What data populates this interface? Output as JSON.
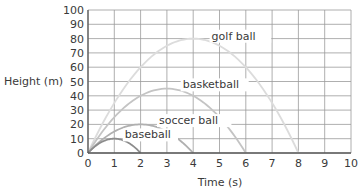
{
  "chart_data": {
    "type": "line",
    "title": "",
    "xlabel": "Time (s)",
    "ylabel": "Height (m)",
    "xlim": [
      0,
      10
    ],
    "ylim": [
      0,
      100
    ],
    "x_ticks": [
      0,
      1,
      2,
      3,
      4,
      5,
      6,
      7,
      8,
      9,
      10
    ],
    "y_ticks": [
      0,
      10,
      20,
      30,
      40,
      50,
      60,
      70,
      80,
      90,
      100
    ],
    "grid": true,
    "legend": "inline labels",
    "series": [
      {
        "name": "baseball",
        "peak_time": 1,
        "peak_height": 10,
        "land_time": 2,
        "x": [
          0,
          0.5,
          1,
          1.5,
          2
        ],
        "y": [
          0,
          7.5,
          10,
          7.5,
          0
        ],
        "color": "#8c8c8c"
      },
      {
        "name": "soccer ball",
        "peak_time": 2,
        "peak_height": 20,
        "land_time": 4,
        "x": [
          0,
          1,
          2,
          3,
          4
        ],
        "y": [
          0,
          15,
          20,
          15,
          0
        ],
        "color": "#b0b0b0"
      },
      {
        "name": "basketball",
        "peak_time": 3,
        "peak_height": 45,
        "land_time": 6,
        "x": [
          0,
          1.5,
          3,
          4.5,
          6
        ],
        "y": [
          0,
          33.75,
          45,
          33.75,
          0
        ],
        "color": "#c4c4c4"
      },
      {
        "name": "golf ball",
        "peak_time": 4,
        "peak_height": 80,
        "land_time": 8,
        "x": [
          0,
          2,
          4,
          6,
          8
        ],
        "y": [
          0,
          60,
          80,
          60,
          0
        ],
        "color": "#dcdcdc"
      }
    ],
    "labels": [
      {
        "text": "golf ball",
        "x": 4.7,
        "y": 82
      },
      {
        "text": "basketball",
        "x": 3.6,
        "y": 48
      },
      {
        "text": "soccer ball",
        "x": 2.7,
        "y": 23
      },
      {
        "text": "baseball",
        "x": 1.4,
        "y": 13
      }
    ]
  }
}
